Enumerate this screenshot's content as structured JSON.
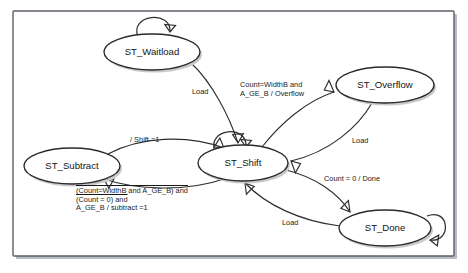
{
  "diagram": {
    "type": "state-machine",
    "title": "",
    "background_color": "#ffffff",
    "frame_color": "#5b5f68",
    "node_stroke_color": "#2a2a2a",
    "edge_color": "#2f2f2f",
    "states": [
      {
        "id": "st_waitload",
        "label": "ST_Waitload",
        "cx": 152,
        "cy": 52,
        "rx": 48,
        "ry": 18
      },
      {
        "id": "st_overflow",
        "label": "ST_Overflow",
        "cx": 385,
        "cy": 85,
        "rx": 49,
        "ry": 18
      },
      {
        "id": "st_shift",
        "label": "ST_Shift",
        "cx": 243,
        "cy": 163,
        "rx": 45,
        "ry": 18
      },
      {
        "id": "st_subtract",
        "label": "ST_Subtract",
        "cx": 72,
        "cy": 166,
        "rx": 48,
        "ry": 18
      },
      {
        "id": "st_done",
        "label": "ST_Done",
        "cx": 385,
        "cy": 228,
        "rx": 46,
        "ry": 18
      }
    ],
    "self_loops": [
      {
        "id": "loop-waitload",
        "on_state": "ST_Waitload",
        "position": "top"
      },
      {
        "id": "loop-shift",
        "on_state": "ST_Shift",
        "position": "top-left"
      },
      {
        "id": "loop-done",
        "on_state": "ST_Done",
        "position": "right"
      }
    ],
    "transitions": [
      {
        "id": "t-waitload-shift",
        "from": "ST_Waitload",
        "to": "ST_Shift",
        "label": "Load",
        "label_x": 192,
        "label_y": 88
      },
      {
        "id": "t-shift-overflow",
        "from": "ST_Shift",
        "to": "ST_Overflow",
        "label_lines": [
          {
            "text": "Count=WidthB and",
            "overline": false
          },
          {
            "text": "A_GE_B / Overflow",
            "overline": false
          }
        ],
        "label_x": 240,
        "label_y": 81
      },
      {
        "id": "t-overflow-shift",
        "from": "ST_Overflow",
        "to": "ST_Shift",
        "label": "Load",
        "label_x": 352,
        "label_y": 137
      },
      {
        "id": "t-subtract-shift",
        "from": "ST_Subtract",
        "to": "ST_Shift",
        "label": "/ Shift =1",
        "label_x": 130,
        "label_y": 136
      },
      {
        "id": "t-shift-subtract",
        "from": "ST_Shift",
        "to": "ST_Subtract",
        "label_lines": [
          {
            "text": "(Count=WidthB and A_GE_B) and",
            "overline": true
          },
          {
            "text": "(Count = 0) and",
            "overline": true
          },
          {
            "text": "A_GE_B / subtract =1",
            "overline": false
          }
        ],
        "label_x": 76,
        "label_y": 187
      },
      {
        "id": "t-shift-done",
        "from": "ST_Shift",
        "to": "ST_Done",
        "label": "Count = 0 / Done",
        "label_x": 324,
        "label_y": 175
      },
      {
        "id": "t-done-shift",
        "from": "ST_Done",
        "to": "ST_Shift",
        "label": "Load",
        "label_x": 282,
        "label_y": 219
      }
    ]
  }
}
